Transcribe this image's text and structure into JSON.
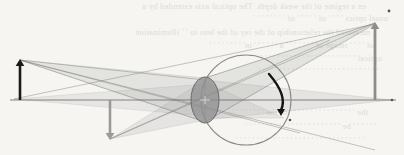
{
  "figure": {
    "width": 404,
    "height": 155,
    "background_color": "#f6f5f2",
    "paper_tone": "#f6f5f2"
  },
  "colors": {
    "paper": "#f6f5f2",
    "axis": "#6e6e6e",
    "object_arrow": "#1a1a1a",
    "image_arrow": "#8d8d8d",
    "secondary_arrow": "#9a9a9a",
    "dark_curved_arrow": "#141414",
    "lens_fill": "#8f8f8f",
    "lens_stroke": "#6b6b6b",
    "circle_stroke": "#8a8a8a",
    "ray_fan": "#9b9b9b",
    "ray_line": "#7d7d7d",
    "bleed_text": "#c9c7c2"
  },
  "optical_axis": {
    "label": "optical-axis",
    "x1": 10,
    "y1": 100,
    "x2": 396,
    "y2": 100,
    "stroke_width": 1.1
  },
  "lens": {
    "label": "thin-lens",
    "center_x": 205,
    "center_y": 100,
    "rx": 14,
    "ry": 23,
    "fill_opacity": 0.75,
    "center_tick": "+"
  },
  "circle": {
    "label": "construction-circle",
    "center_x": 246,
    "center_y": 100,
    "radius": 45,
    "stroke_width": 1.1
  },
  "arrows": [
    {
      "name": "object-arrow",
      "role": "object",
      "direction": "up",
      "x": 20,
      "y_base": 100,
      "y_tip": 59,
      "color": "#1a1a1a",
      "stroke_width": 2.6,
      "head_size": 7
    },
    {
      "name": "image-arrow",
      "role": "image",
      "direction": "up",
      "x": 375,
      "y_base": 100,
      "y_tip": 22,
      "color": "#8d8d8d",
      "stroke_width": 2.8,
      "head_size": 7
    },
    {
      "name": "secondary-object-arrow",
      "role": "secondary-object",
      "direction": "down",
      "x": 110,
      "y_base": 100,
      "y_tip": 140,
      "color": "#9a9a9a",
      "stroke_width": 2.6,
      "head_size": 7
    }
  ],
  "curved_arrow": {
    "name": "curved-ray-arrow",
    "start_x": 269,
    "start_y": 74,
    "ctrl_x": 288,
    "ctrl_y": 96,
    "end_x": 281,
    "end_y": 116,
    "color": "#141414",
    "stroke_width": 2.4
  },
  "markers": [
    {
      "name": "image-tip-marker",
      "x": 389,
      "y": 11,
      "r": 1.4
    },
    {
      "name": "axis-right-marker",
      "x": 392,
      "y": 100,
      "r": 1.3
    },
    {
      "name": "curved-arrow-marker",
      "x": 290,
      "y": 120,
      "r": 1.3
    }
  ],
  "ray_fans": [
    {
      "name": "fan-object-tip-to-lens",
      "apex_x": 20,
      "apex_y": 60,
      "top_x": 205,
      "top_y": 78,
      "bottom_x": 205,
      "bottom_y": 122,
      "opacity": 0.2
    },
    {
      "name": "fan-lens-to-image-tip",
      "apex_x": 375,
      "apex_y": 23,
      "top_x": 205,
      "top_y": 78,
      "bottom_x": 205,
      "bottom_y": 122,
      "opacity": 0.2
    },
    {
      "name": "fan-secondary-tip-to-lens",
      "apex_x": 110,
      "apex_y": 139,
      "top_x": 205,
      "top_y": 80,
      "bottom_x": 205,
      "bottom_y": 120,
      "opacity": 0.18
    },
    {
      "name": "fan-lens-to-axis-right",
      "apex_x": 392,
      "apex_y": 100,
      "top_x": 205,
      "top_y": 80,
      "bottom_x": 205,
      "bottom_y": 120,
      "opacity": 0.18
    },
    {
      "name": "fan-axis-left-to-lens",
      "apex_x": 14,
      "apex_y": 99,
      "top_x": 205,
      "top_y": 84,
      "bottom_x": 205,
      "bottom_y": 116,
      "opacity": 0.16
    },
    {
      "name": "fan-lens-to-curved-arrow",
      "apex_x": 284,
      "apex_y": 118,
      "top_x": 205,
      "top_y": 82,
      "bottom_x": 205,
      "bottom_y": 118,
      "opacity": 0.16
    }
  ],
  "ray_lines": [
    {
      "name": "ray-object-tip-through-center",
      "x1": 20,
      "y1": 60,
      "x2": 375,
      "y2": 150
    },
    {
      "name": "ray-object-tip-upper",
      "x1": 20,
      "y1": 60,
      "x2": 300,
      "y2": 133
    },
    {
      "name": "ray-secondary-tip-up",
      "x1": 110,
      "y1": 139,
      "x2": 375,
      "y2": 23
    },
    {
      "name": "ray-secondary-tip-up2",
      "x1": 110,
      "y1": 139,
      "x2": 330,
      "y2": 40
    },
    {
      "name": "ray-axis-left-to-image",
      "x1": 14,
      "y1": 99,
      "x2": 375,
      "y2": 24
    },
    {
      "name": "ray-lens-top-to-image",
      "x1": 205,
      "y1": 78,
      "x2": 375,
      "y2": 23
    },
    {
      "name": "ray-lens-bottom-to-image",
      "x1": 205,
      "y1": 122,
      "x2": 375,
      "y2": 24
    },
    {
      "name": "ray-object-to-lens-bottom",
      "x1": 20,
      "y1": 60,
      "x2": 205,
      "y2": 122
    },
    {
      "name": "ray-object-to-lens-top",
      "x1": 20,
      "y1": 60,
      "x2": 205,
      "y2": 80
    }
  ],
  "background_text": {
    "note": "faint mirrored bleed-through text from reverse side of scanned page",
    "lines": [
      {
        "top": 2,
        "left": 6,
        "text": "en a regime of the weak depth. The optical axis extended by a"
      },
      {
        "top": 14,
        "left": 28,
        "text": "usual optics ' ' ' ' of ' ' ' ' ' of ' ' ' ' ' ' ' '"
      },
      {
        "top": 28,
        "left": 10,
        "text": "measured the relationship of the ray of the lens to ' ' illumination"
      },
      {
        "top": 41,
        "left": 14,
        "text": "of ' ' ' ' image of ' ' ' ' ' ' ' a ' ' ' ' ' ' in' ' ' ' ' ' ' ' '"
      },
      {
        "top": 54,
        "left": 22,
        "text": "optical ' ' ' ' ' ' ' ' ' ' ' ' ' ' ' ' ' ' ' ' ' ' '"
      },
      {
        "top": 67,
        "left": 18,
        "text": "' ' ' ' ' ' ' ' ' ' ' ' ' ' ' ' ' ' ' ' ' ' ' ' ' ' ' ' '"
      },
      {
        "top": 108,
        "left": 8,
        "text": "the ' ' ' ' ' ' ' ' ' ' ' ' ' ' ' ' of the ' ' ' ' ' ' ' ' '"
      },
      {
        "top": 122,
        "left": 16,
        "text": "' ' ' ' ' ' be ' ' ' ' ' ' ' ' ' ' ' ' ' ' ' ' ' ' ' ' ' ' '"
      },
      {
        "top": 136,
        "left": 4,
        "text": "' ' ' ' ' ' ' ' ' ' ' ' ' ' ' ' ' ' ' ' ' ' ' ' ' ' ' ' ' ' '"
      }
    ]
  }
}
